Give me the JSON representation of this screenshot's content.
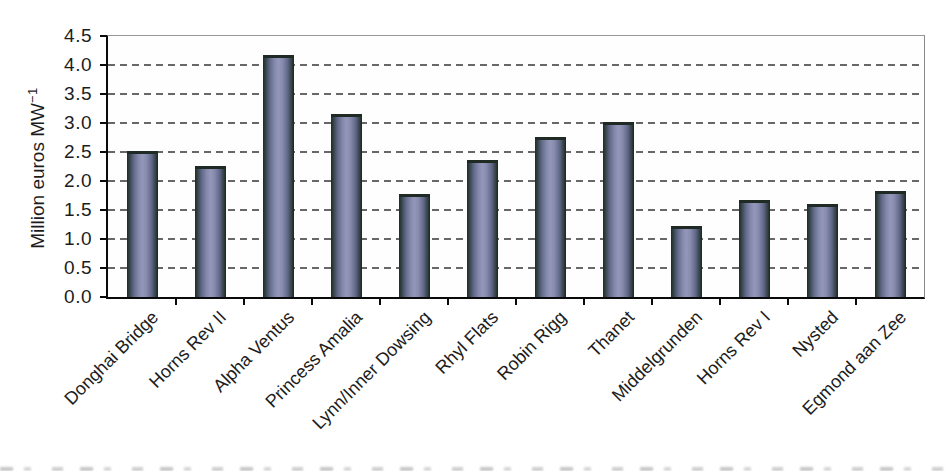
{
  "chart_data": {
    "type": "bar",
    "title": "",
    "categories": [
      "Donghai Bridge",
      "Horns Rev II",
      "Alpha Ventus",
      "Princess Amalia",
      "Lynn/Inner Dowsing",
      "Rhyl Flats",
      "Robin Rigg",
      "Thanet",
      "Middelgrunden",
      "Horns Rev I",
      "Nysted",
      "Egmond aan Zee"
    ],
    "values": [
      2.52,
      2.25,
      4.17,
      3.15,
      1.78,
      2.37,
      2.75,
      3.02,
      1.23,
      1.67,
      1.6,
      1.82
    ],
    "xlabel": "",
    "ylabel_base": "Million euros MW",
    "ylabel_exponent": "−1",
    "ylim": [
      0,
      4.5
    ],
    "ytick_step": 0.5,
    "ytick_labels": [
      "0.0",
      "0.5",
      "1.0",
      "1.5",
      "2.0",
      "2.5",
      "3.0",
      "3.5",
      "4.0",
      "4.5"
    ],
    "grid": "horizontal-dashed",
    "legend_position": "none",
    "x_label_rotation_deg": 45
  },
  "style": {
    "background_color": "#ffffff",
    "text_color": "#1c1c1c",
    "axis_color": "#0a0a0a",
    "gridline_color": "#4d4d4d",
    "bar_center_color": "#9497b8",
    "bar_mid_color": "#5f6787",
    "bar_edge_color": "#1d2c26",
    "bar_cap_color": "#1f2a25"
  }
}
